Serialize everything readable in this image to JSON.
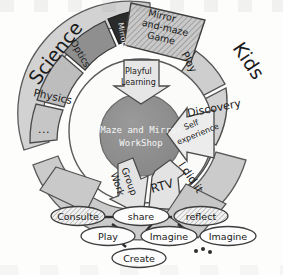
{
  "diagram": {
    "center": {
      "line1": "Maze and Mirror",
      "line2": "WorkShop",
      "color": "#8c8c8c"
    },
    "outer_labels": {
      "left": "Science",
      "right": "Kids"
    },
    "science_ring": [
      {
        "label": "Mirrors",
        "shade": "dark",
        "color": "#2b2b2b"
      },
      {
        "label": "Optics",
        "shade": "mid",
        "color": "#8f8f8f"
      },
      {
        "label": "Physics",
        "shade": "light",
        "color": "#b9b9b9"
      },
      {
        "label": "...",
        "shade": "light",
        "color": "#c4c4c4"
      }
    ],
    "kids_ring": [
      {
        "label": "Mirror and-maze Game",
        "shade": "hatched",
        "color": "#bdbdbd"
      },
      {
        "label": "Play",
        "shade": "light",
        "color": "#cfcfcf"
      },
      {
        "label": "Discovery",
        "shade": "light",
        "color": "#cfcfcf"
      },
      {
        "label": "I did it",
        "shade": "light",
        "color": "#cfcfcf"
      }
    ],
    "arrows": [
      {
        "label": "Playful Learning",
        "direction": "inward-from-top"
      },
      {
        "label": "Self experience",
        "direction": "inward-from-right"
      },
      {
        "label": "Group Work",
        "direction": "outward-up-left"
      },
      {
        "label": "RTV",
        "direction": "outward-up-right"
      }
    ],
    "bottom_nodes": {
      "row1": [
        {
          "label": "Consulte",
          "fill": "hatched"
        },
        {
          "label": "share",
          "fill": "plain"
        },
        {
          "label": "reflect",
          "fill": "hatched"
        }
      ],
      "row2": [
        {
          "label": "Play",
          "fill": "plain"
        },
        {
          "label": "Imagine",
          "fill": "plain"
        },
        {
          "label": "Imagine",
          "fill": "plain"
        }
      ],
      "row3": [
        {
          "label": "Create",
          "fill": "plain"
        }
      ],
      "ellipsis": "..."
    },
    "colors": {
      "ring_outer_light": "#cfcfcf",
      "ring_outer_lighter": "#d9d9d9",
      "ring_inner_mid": "#8f8f8f",
      "ring_inner_light": "#b9b9b9",
      "center_gray": "#8c8c8c",
      "dark_segment": "#2b2b2b",
      "stroke": "#555555",
      "node_fill": "#fbfbfb"
    }
  }
}
